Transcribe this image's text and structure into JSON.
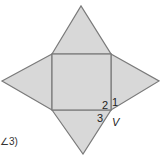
{
  "diagram": {
    "type": "square pyramid net",
    "fill_color": "#d8d8d8",
    "stroke_color": "#7a7a7a",
    "square": {
      "x1": 52,
      "y1": 54,
      "x2": 111,
      "y2": 110
    },
    "apexes": {
      "top": [
        81,
        6
      ],
      "left": [
        2,
        81
      ],
      "right": [
        159,
        81
      ],
      "bottom": [
        83,
        154
      ]
    },
    "labels": {
      "angle1": "1",
      "angle2": "2",
      "angle3": "3",
      "vertex": "V"
    },
    "partial_text": "∠3)"
  }
}
